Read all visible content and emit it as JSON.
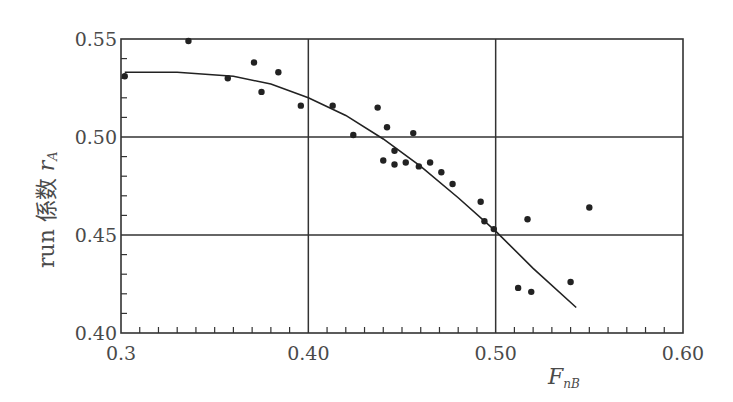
{
  "chart_data": {
    "type": "scatter",
    "title": "",
    "xlabel": "F_nB",
    "ylabel": "run 係数 r_A",
    "xlim": [
      0.3,
      0.6
    ],
    "ylim": [
      0.4,
      0.55
    ],
    "x_ticks": [
      "0.3",
      "0.40",
      "0.50",
      "0.60"
    ],
    "x_tick_values": [
      0.3,
      0.4,
      0.5,
      0.6
    ],
    "y_ticks": [
      "0.40",
      "0.45",
      "0.50",
      "0.55"
    ],
    "y_tick_values": [
      0.4,
      0.45,
      0.5,
      0.55
    ],
    "grid": true,
    "legend": null,
    "series": [
      {
        "name": "measured",
        "kind": "scatter",
        "x": [
          0.302,
          0.336,
          0.357,
          0.371,
          0.375,
          0.384,
          0.396,
          0.413,
          0.424,
          0.437,
          0.44,
          0.442,
          0.446,
          0.446,
          0.452,
          0.456,
          0.459,
          0.465,
          0.471,
          0.477,
          0.492,
          0.494,
          0.499,
          0.512,
          0.517,
          0.519,
          0.54,
          0.55
        ],
        "y": [
          0.531,
          0.549,
          0.53,
          0.538,
          0.523,
          0.533,
          0.516,
          0.516,
          0.501,
          0.515,
          0.488,
          0.505,
          0.493,
          0.486,
          0.487,
          0.502,
          0.485,
          0.487,
          0.482,
          0.476,
          0.467,
          0.457,
          0.453,
          0.423,
          0.458,
          0.421,
          0.426,
          0.464
        ]
      },
      {
        "name": "fitted curve",
        "kind": "line",
        "x": [
          0.302,
          0.33,
          0.36,
          0.38,
          0.4,
          0.42,
          0.44,
          0.46,
          0.48,
          0.5,
          0.52,
          0.543
        ],
        "y": [
          0.533,
          0.533,
          0.531,
          0.527,
          0.52,
          0.511,
          0.499,
          0.485,
          0.469,
          0.452,
          0.433,
          0.413
        ]
      }
    ]
  },
  "axes": {
    "x_title_main": "F",
    "x_title_sub": "nB",
    "y_title_prefix": "run 係数 ",
    "y_title_var": "r",
    "y_title_sub": "A"
  }
}
